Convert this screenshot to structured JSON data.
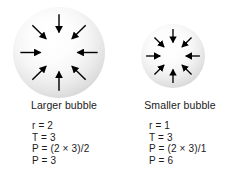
{
  "figure": {
    "background_color": "#ffffff",
    "text_color": "#1a1a1a"
  },
  "bubbles": [
    {
      "id": "larger",
      "caption": "Larger bubble",
      "arrow_count": 8,
      "arrow_direction": "inward",
      "arrow_color": "#000000",
      "fill_highlight_color": "#ffffff",
      "fill_edge_color": "#bcbcbc",
      "formulas": [
        "r = 2",
        "T = 3",
        "P = (2 × 3)/2",
        "P = 3"
      ]
    },
    {
      "id": "smaller",
      "caption": "Smaller bubble",
      "arrow_count": 8,
      "arrow_direction": "inward",
      "arrow_color": "#000000",
      "fill_highlight_color": "#ffffff",
      "fill_edge_color": "#bcbcbc",
      "formulas": [
        "r = 1",
        "T = 3",
        "P = (2 × 3)/1",
        "P = 6"
      ]
    }
  ]
}
